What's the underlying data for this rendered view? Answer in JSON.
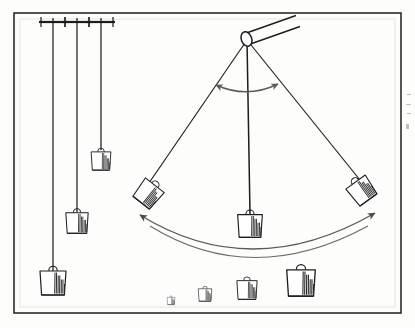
{
  "figure": {
    "background_color": "#fdfdfb",
    "ink_color": "#1a1a1a",
    "arrow_color": "#4a4a4a",
    "frame": {
      "label": "figure-border",
      "x": 14,
      "y": 13,
      "width": 387,
      "height": 300,
      "stroke": "#2b2b2b",
      "stroke_width": 1.6
    },
    "inner_frame": {
      "label": "inner-hairline",
      "x": 20,
      "y": 19,
      "width": 375,
      "height": 288,
      "stroke": "#d8d6d0",
      "stroke_width": 0.6
    }
  },
  "hanging_pendulums": {
    "label": "vertical-plumb-lines",
    "count": 3,
    "support_bar": {
      "label": "ceiling-support-bracket",
      "width": 28,
      "thickness": 2.2,
      "hook_height": 6
    },
    "items": [
      {
        "name": "long-plumb",
        "support_x": 53,
        "support_y": 22,
        "cord_length": 249,
        "bob_scale": 1.0,
        "cord_x": 53
      },
      {
        "name": "medium-plumb",
        "support_x": 77,
        "support_y": 22,
        "cord_length": 190,
        "bob_scale": 0.86,
        "cord_x": 77
      },
      {
        "name": "short-plumb",
        "support_x": 101,
        "support_y": 22,
        "cord_length": 127,
        "bob_scale": 0.76,
        "cord_x": 101
      }
    ]
  },
  "swinging_pendulum": {
    "label": "swinging-pendulum-assembly",
    "pivot": {
      "x": 247,
      "y": 40,
      "name": "pivot-point"
    },
    "rod": {
      "name": "support-rod",
      "near_center_x": 245,
      "near_center_y": 39,
      "far_center_x": 292,
      "far_center_y": 22,
      "radius_x": 5.5,
      "radius_y": 7.5,
      "angle_deg": -20
    },
    "cords": [
      {
        "name": "cord-left-extreme",
        "x2": 146,
        "y2": 185
      },
      {
        "name": "cord-center-rest",
        "x2": 250,
        "y2": 216
      },
      {
        "name": "cord-right-extreme",
        "x2": 362,
        "y2": 182
      }
    ],
    "bobs": [
      {
        "name": "bob-left-extreme",
        "x": 146,
        "y": 192,
        "rotation": 38,
        "scale": 0.92
      },
      {
        "name": "bob-center-rest",
        "x": 250,
        "y": 224,
        "rotation": 0,
        "scale": 0.95
      },
      {
        "name": "bob-right-extreme",
        "x": 363,
        "y": 189,
        "rotation": -36,
        "scale": 0.92
      }
    ],
    "angle_arrow": {
      "name": "angle-swing-arrow",
      "path": "M 216 85 Q 247 99 278 84",
      "double_headed": true
    },
    "swing_arcs": [
      {
        "name": "swing-arc-outer",
        "path": "M 137 215 Q 252 283 377 213",
        "double_headed": true
      },
      {
        "name": "swing-arc-inner",
        "path": "M 147 224 Q 252 288 370 224",
        "double_headed": false
      }
    ]
  },
  "weight_set": {
    "label": "graduated-weight-row",
    "baseline_y": 305,
    "items": [
      {
        "name": "weight-smallest",
        "x": 171,
        "scale": 0.3
      },
      {
        "name": "weight-small",
        "x": 205,
        "scale": 0.52
      },
      {
        "name": "weight-medium",
        "x": 247,
        "scale": 0.78
      },
      {
        "name": "weight-large",
        "x": 301,
        "scale": 1.1
      }
    ]
  },
  "bob_style": {
    "body_width": 26,
    "body_height": 24,
    "taper": 3,
    "ring_radius": 4.2,
    "hatch_count": 7,
    "hatch_color": "#2a2a2a",
    "body_fill": "#ffffff",
    "stroke": "#1d1d1d"
  },
  "margin_marks": {
    "label": "scan-edge-marks",
    "marks": [
      {
        "x": 407,
        "y": 94,
        "w": 4,
        "h": 1
      },
      {
        "x": 406,
        "y": 104,
        "w": 5,
        "h": 1
      },
      {
        "x": 407,
        "y": 113,
        "w": 4,
        "h": 1
      },
      {
        "x": 406,
        "y": 124,
        "w": 3,
        "h": 5
      }
    ]
  }
}
